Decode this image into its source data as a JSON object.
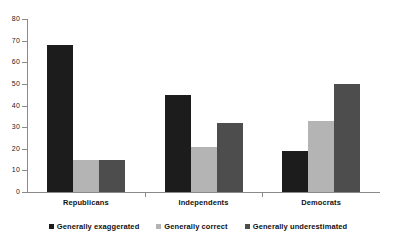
{
  "chart_data": {
    "type": "bar",
    "title": "",
    "subtitle": "",
    "xlabel": "",
    "ylabel": "",
    "categories": [
      "Republicans",
      "Independents",
      "Democrats"
    ],
    "series": [
      {
        "name": "Generally exaggerated",
        "color": "#1c1c1c",
        "values": [
          68,
          45,
          19
        ]
      },
      {
        "name": "Generally correct",
        "color": "#b4b4b4",
        "values": [
          15,
          21,
          33
        ]
      },
      {
        "name": "Generally underestimated",
        "color": "#4d4d4d",
        "values": [
          15,
          32,
          50
        ]
      }
    ],
    "ylim": [
      0,
      80
    ],
    "ytick_step": 10,
    "yticks": [
      0,
      10,
      20,
      30,
      40,
      50,
      60,
      70,
      80
    ],
    "ytick_labels": [
      "0",
      "10",
      "20",
      "30",
      "40",
      "50",
      "60",
      "70",
      "80"
    ],
    "grid": false,
    "legend_position": "bottom",
    "annotations": []
  },
  "colors": {
    "background": "#ffffff",
    "axis": "#8a8a8a",
    "text": "#111111"
  }
}
